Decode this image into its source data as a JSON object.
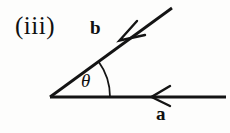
{
  "figure": {
    "part_label": "(iii)",
    "background_color": "#fdfdfc",
    "stroke_color": "#141414",
    "labels": {
      "vector_b": "b",
      "vector_a": "a",
      "angle": "θ"
    },
    "geometry": {
      "vertex": [
        50,
        97
      ],
      "horizontal_line_end": [
        226,
        97
      ],
      "diagonal_line_end": [
        172,
        8
      ],
      "angle_degrees": 36,
      "arc_radius": 60,
      "arc_start": [
        98,
        61
      ],
      "arc_end": [
        110,
        97
      ],
      "arrowhead_b_tip": [
        120,
        40
      ],
      "arrowhead_a_tip": [
        152,
        97
      ],
      "line_width": 2.6
    },
    "icons": {
      "arrowhead_b": "arrowhead-left-down-icon",
      "arrowhead_a": "arrowhead-left-icon"
    }
  }
}
